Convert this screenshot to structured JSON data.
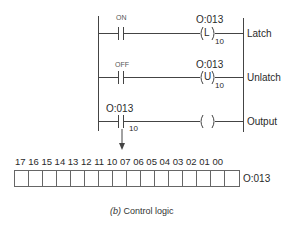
{
  "rungs": [
    {
      "contact_label": "ON",
      "coil_address": "O:013",
      "coil_symbol": "L",
      "coil_bit": "10",
      "side_label": "Latch"
    },
    {
      "contact_label": "OFF",
      "coil_address": "O:013",
      "coil_symbol": "U",
      "coil_bit": "10",
      "side_label": "Unlatch"
    },
    {
      "contact_label": "O:013",
      "contact_bit": "10",
      "coil_symbol": "",
      "side_label": "Output"
    }
  ],
  "register": {
    "bit_labels": "17 16 15 14 13 12 11 10 07 06 05 04 03 02 01 00",
    "bits": [
      "17",
      "16",
      "15",
      "14",
      "13",
      "12",
      "11",
      "10",
      "07",
      "06",
      "05",
      "04",
      "03",
      "02",
      "01",
      "00"
    ],
    "address": "O:013"
  },
  "caption": {
    "letter": "(b)",
    "text": " Control logic"
  }
}
